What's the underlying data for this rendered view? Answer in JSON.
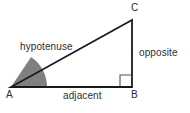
{
  "diagram": {
    "background_color": "#ffffff",
    "stroke_color": "#1a1a1a",
    "text_color": "#2e2e2e",
    "angle_fill_color": "#808080",
    "vertices": {
      "a": {
        "label": "A",
        "x": 11,
        "y": 87
      },
      "b": {
        "label": "B",
        "x": 132,
        "y": 87
      },
      "c": {
        "label": "C",
        "x": 132,
        "y": 20
      }
    },
    "sides": {
      "hypotenuse": {
        "label": "hypotenuse",
        "from": "A",
        "to": "C"
      },
      "adjacent": {
        "label": "adjacent",
        "from": "A",
        "to": "B"
      },
      "opposite": {
        "label": "opposite",
        "from": "B",
        "to": "C"
      }
    },
    "markers": {
      "right_angle": {
        "name": "right-angle-square",
        "at": "B",
        "size": 11
      },
      "theta_angle": {
        "name": "shaded-angle-sector",
        "at": "A",
        "radius": 36
      }
    }
  }
}
